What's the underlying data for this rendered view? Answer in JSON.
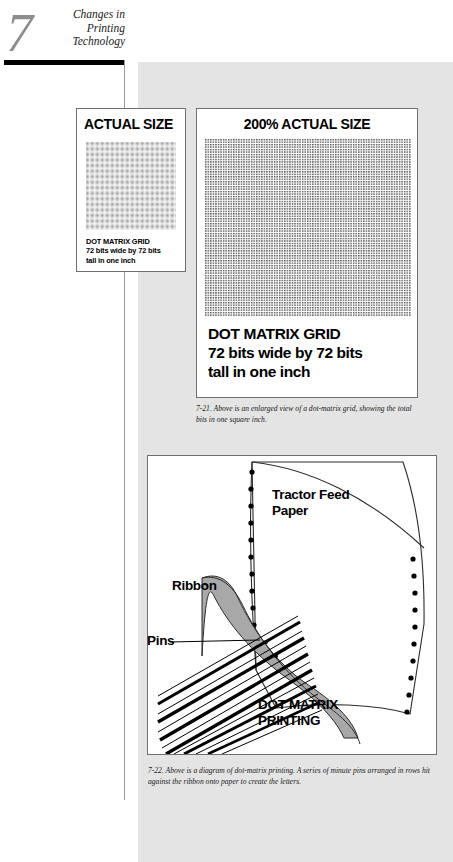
{
  "chapter": {
    "number": "7",
    "title_lines": [
      "Changes in",
      "Printing",
      "Technology"
    ]
  },
  "figures": {
    "actual_size": {
      "heading": "ACTUAL SIZE",
      "caption_lines": [
        "DOT MATRIX GRID",
        "72 bits wide by 72 bits",
        "tall in one inch"
      ]
    },
    "enlarged": {
      "heading": "200% ACTUAL SIZE",
      "caption_lines": [
        "DOT MATRIX GRID",
        "72 bits wide by 72 bits",
        "tall in one inch"
      ]
    },
    "diagram": {
      "labels": {
        "tractor_feed": "Tractor Feed\nPaper",
        "tractor_feed_line1": "Tractor Feed",
        "tractor_feed_line2": "Paper",
        "ribbon": "Ribbon",
        "pins": "Pins",
        "title_line1": "DOT MATRIX",
        "title_line2": "PRINTING"
      }
    }
  },
  "captions": {
    "fig_7_21": "7-21. Above is an enlarged view of a dot-matrix grid, showing the total bits in one square inch.",
    "fig_7_22": "7-22. Above is a diagram of dot-matrix printing. A series of minute pins arranged in rows hit against the ribbon onto paper to create the letters."
  },
  "colors": {
    "gray_field": "#e4e4e4",
    "ribbon_fill": "#a8a8a8",
    "rule_black": "#000000",
    "chapter_number": "#8d8d8d"
  }
}
